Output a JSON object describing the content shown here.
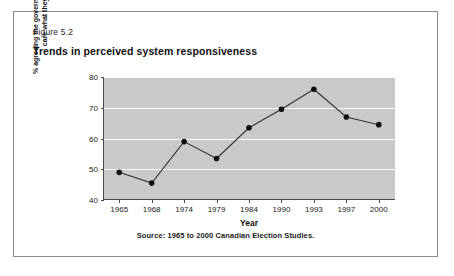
{
  "figure": {
    "number": "Figure 5.2",
    "title": "Trends in perceived system responsiveness",
    "source": "Source: 1965 to 2000 Canadian Election Studies."
  },
  "chart_data": {
    "type": "line",
    "title": "Trends in perceived system responsiveness",
    "xlabel": "Year",
    "ylabel_line1": "% agreeing the government does not",
    "ylabel_line2": "care what they think",
    "categories": [
      "1965",
      "1968",
      "1974",
      "1979",
      "1984",
      "1990",
      "1993",
      "1997",
      "2000"
    ],
    "values": [
      49,
      45.5,
      59,
      53.5,
      63.5,
      69.5,
      76,
      67,
      64.5
    ],
    "ylim": [
      40,
      80
    ],
    "yticks": [
      "40",
      "50",
      "60",
      "70",
      "80"
    ],
    "grid": true,
    "legend": "none",
    "plot_background": "#c9c9c9",
    "gridline_color": "#ffffff",
    "line_color": "#333333",
    "marker_color": "#111111"
  }
}
